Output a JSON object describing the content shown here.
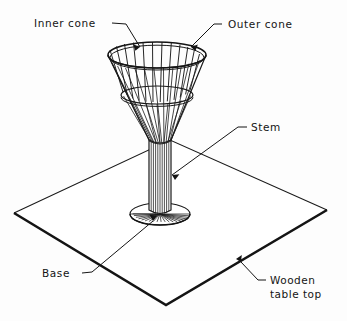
{
  "diagram": {
    "background_color": "#fdfdfd",
    "line_color": "#1a1a1a",
    "fill_color": "#ffffff",
    "labels": {
      "inner_cone": "Inner cone",
      "outer_cone": "Outer cone",
      "stem": "Stem",
      "base": "Base",
      "wooden_table_top_line1": "Wooden",
      "wooden_table_top_line2": "table top"
    },
    "parts": [
      {
        "name": "inner-cone",
        "label": "Inner cone"
      },
      {
        "name": "outer-cone",
        "label": "Outer cone"
      },
      {
        "name": "stem",
        "label": "Stem"
      },
      {
        "name": "base",
        "label": "Base"
      },
      {
        "name": "wooden-table-top",
        "label": "Wooden table top"
      }
    ],
    "geometry": {
      "table_corners": "14,213 170,140 327,210 166,305",
      "cone_rim_center_x": 157,
      "cone_rim_center_y": 55,
      "cone_rim_rx": 49,
      "cone_rim_ry": 13,
      "inner_rim_center_y": 95,
      "inner_rim_rx": 36,
      "inner_rim_ry": 9,
      "cone_apex_x": 158,
      "cone_apex_y": 196,
      "stem_top_y": 140,
      "stem_bottom_y": 213,
      "stem_half_width": 9,
      "base_center_x": 160,
      "base_center_y": 214,
      "base_rx": 30,
      "base_ry": 11,
      "cone_rib_count": 11,
      "base_spoke_count": 19
    }
  }
}
